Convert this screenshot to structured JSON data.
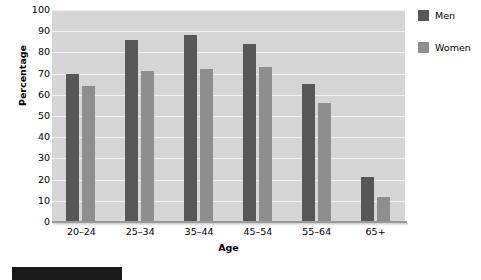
{
  "chart_data": {
    "type": "bar",
    "title": "",
    "xlabel": "Age",
    "ylabel": "Percentage",
    "categories": [
      "20–24",
      "25–34",
      "35–44",
      "45–54",
      "55–64",
      "65+"
    ],
    "series": [
      {
        "name": "Men",
        "color": "#575757",
        "values": [
          70,
          86,
          88,
          84,
          65,
          21
        ]
      },
      {
        "name": "Women",
        "color": "#8e8e8e",
        "values": [
          64,
          71,
          72,
          73,
          56,
          12
        ]
      }
    ],
    "ylim": [
      0,
      100
    ],
    "ytick_step": 10,
    "yticks": [
      100,
      90,
      80,
      70,
      60,
      50,
      40,
      30,
      20,
      10,
      0
    ],
    "grid": true,
    "legend_position": "right",
    "plot_background": "#d5d5d5",
    "gridline_color": "#f2f2f2"
  },
  "legend": {
    "items": [
      {
        "label": "Men",
        "color": "#575757"
      },
      {
        "label": "Women",
        "color": "#8e8e8e"
      }
    ]
  },
  "caption": {
    "number": "12.3"
  }
}
